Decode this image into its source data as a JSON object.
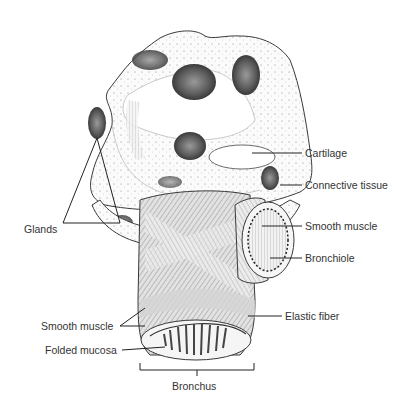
{
  "figure": {
    "labels": {
      "cartilage": "Cartilage",
      "connective_tissue": "Connective tissue",
      "glands": "Glands",
      "smooth_muscle_right": "Smooth muscle",
      "bronchiole": "Bronchiole",
      "elastic_fiber": "Elastic fiber",
      "smooth_muscle_left": "Smooth muscle",
      "folded_mucosa": "Folded mucosa",
      "bronchus": "Bronchus"
    },
    "caption_fragment": ""
  }
}
